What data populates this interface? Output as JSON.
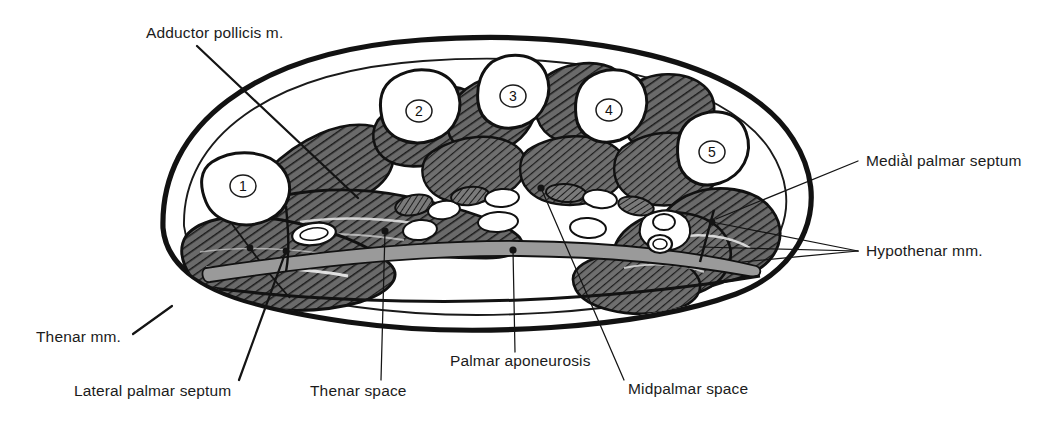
{
  "figure": {
    "background_color": "#ffffff",
    "width": 1047,
    "height": 428
  },
  "colors": {
    "ink": "#141414",
    "muscle_fill": "#6a6a6a",
    "muscle_hatch": "#1a1a1a",
    "bone_fill": "#ffffff",
    "aponeurosis_fill": "#9a9a9a",
    "subcutaneous_fill": "#ffffff",
    "label_text": "#1b1b1b"
  },
  "labels": [
    {
      "id": "adductor-pollicis",
      "text": "Adductor pollicis m.",
      "x": 146,
      "y": 38,
      "anchor": "start",
      "leader": "M 197,46 L 358,198"
    },
    {
      "id": "medial-palmar-septum",
      "text": "Medià̀l palmar septum",
      "display_text": "Medià l palmar septum",
      "x": 866,
      "y": 166,
      "anchor": "start",
      "leader": "M 858,161 L 716,219"
    },
    {
      "id": "hypothenar-mm",
      "text": "Hypothenar mm.",
      "x": 866,
      "y": 256,
      "anchor": "start",
      "leader_fan": [
        "M 858,251 L 712,222",
        "M 858,251 L 700,247",
        "M 858,251 L 742,262"
      ]
    },
    {
      "id": "thenar-mm",
      "text": "Thenar mm.",
      "x": 36,
      "y": 342,
      "anchor": "start",
      "leader": "M 133,334 L 167,309"
    },
    {
      "id": "lateral-palmar-septum",
      "text": "Lateral palmar septum",
      "x": 74,
      "y": 396,
      "anchor": "start",
      "leader": "M 239,380 L 286,251"
    },
    {
      "id": "thenar-space",
      "text": "Thenar space",
      "x": 310,
      "y": 396,
      "anchor": "start",
      "leader": "M 381,380 L 385,231"
    },
    {
      "id": "palmar-aponeurosis",
      "text": "Palmar aponeurosis",
      "x": 450,
      "y": 366,
      "anchor": "start",
      "leader": "M 515,352 L 513,250"
    },
    {
      "id": "midpalmar-space",
      "text": "Midpalmar space",
      "x": 628,
      "y": 394,
      "anchor": "start",
      "leader": "M 624,380 L 541,188"
    }
  ],
  "metacarpals": [
    {
      "id": "metacarpal-1",
      "number": "1",
      "cx": 243,
      "cy": 186
    },
    {
      "id": "metacarpal-2",
      "number": "2",
      "cx": 419,
      "cy": 111
    },
    {
      "id": "metacarpal-3",
      "number": "3",
      "cx": 513,
      "cy": 96
    },
    {
      "id": "metacarpal-4",
      "number": "4",
      "cx": 609,
      "cy": 110
    },
    {
      "id": "metacarpal-5",
      "number": "5",
      "cx": 712,
      "cy": 152
    }
  ],
  "structures": [
    {
      "id": "skin-outline",
      "name": "hand skin outline"
    },
    {
      "id": "adductor-pollicis-muscle",
      "name": "adductor pollicis muscle"
    },
    {
      "id": "thenar-muscle-mass",
      "name": "thenar muscle mass"
    },
    {
      "id": "hypothenar-muscle-mass",
      "name": "hypothenar muscle mass"
    },
    {
      "id": "interosseous-muscles",
      "name": "interosseous muscles"
    },
    {
      "id": "palmar-aponeurosis-band",
      "name": "palmar aponeurosis"
    },
    {
      "id": "flexor-tendons",
      "name": "flexor tendons and lumbricals"
    },
    {
      "id": "thenar-space-region",
      "name": "thenar space"
    },
    {
      "id": "midpalmar-space-region",
      "name": "midpalmar space"
    }
  ]
}
